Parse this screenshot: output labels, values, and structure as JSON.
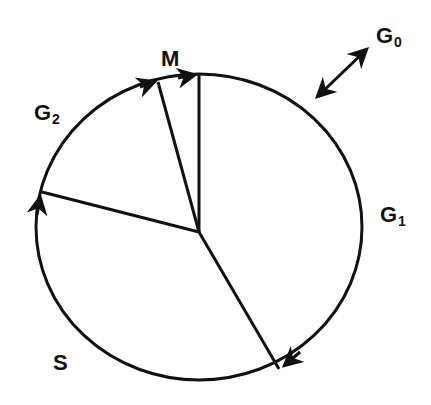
{
  "phases": [
    {
      "id": "G1",
      "letter": "G",
      "sub": "1"
    },
    {
      "id": "S",
      "letter": "S",
      "sub": ""
    },
    {
      "id": "G2",
      "letter": "G",
      "sub": "2"
    },
    {
      "id": "M",
      "letter": "M",
      "sub": ""
    }
  ],
  "quiescent": {
    "id": "G0",
    "letter": "G",
    "sub": "0",
    "relation": "bidirectional exit from G1"
  },
  "colors": {
    "stroke": "#111111",
    "background": "#ffffff"
  }
}
